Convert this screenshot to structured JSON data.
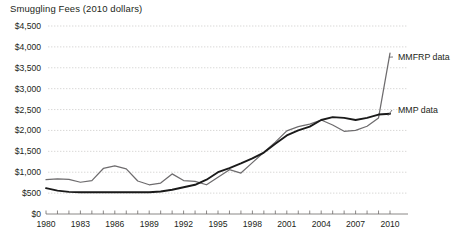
{
  "chart_data": {
    "type": "line",
    "title": "Smuggling Fees (2010 dollars)",
    "xlabel": "",
    "ylabel": "",
    "xlim": [
      1980,
      2010
    ],
    "ylim": [
      0,
      4500
    ],
    "ytick_step": 500,
    "grid": true,
    "legend_position": "inline-right",
    "x": [
      1980,
      1981,
      1982,
      1983,
      1984,
      1985,
      1986,
      1987,
      1988,
      1989,
      1990,
      1991,
      1992,
      1993,
      1994,
      1995,
      1996,
      1997,
      1998,
      1999,
      2000,
      2001,
      2002,
      2003,
      2004,
      2005,
      2006,
      2007,
      2008,
      2009,
      2010
    ],
    "categories": [
      "1980",
      "1981",
      "1982",
      "1983",
      "1984",
      "1985",
      "1986",
      "1987",
      "1988",
      "1989",
      "1990",
      "1991",
      "1992",
      "1993",
      "1994",
      "1995",
      "1996",
      "1997",
      "1998",
      "1999",
      "2000",
      "2001",
      "2002",
      "2003",
      "2004",
      "2005",
      "2006",
      "2007",
      "2008",
      "2009",
      "2010"
    ],
    "xtick_labels": [
      "1980",
      "1983",
      "1986",
      "1989",
      "1992",
      "1995",
      "1998",
      "2001",
      "2004",
      "2007",
      "2010"
    ],
    "ytick_labels": [
      "$0",
      "$500",
      "$1,000",
      "$1,500",
      "$2,000",
      "$2,500",
      "$3,000",
      "$3,500",
      "$4,000",
      "$4,500"
    ],
    "ytick_values": [
      0,
      500,
      1000,
      1500,
      2000,
      2500,
      3000,
      3500,
      4000,
      4500
    ],
    "series": [
      {
        "name": "MMFRP data",
        "label": "MMFRP data",
        "color": "#6e6c6e",
        "values": [
          820,
          840,
          830,
          760,
          800,
          1090,
          1150,
          1080,
          790,
          700,
          740,
          960,
          800,
          780,
          700,
          880,
          1060,
          980,
          1230,
          1480,
          1720,
          1990,
          2090,
          2150,
          2250,
          2130,
          1980,
          2000,
          2100,
          2300,
          3850
        ]
      },
      {
        "name": "MMP data",
        "label": "MMP data",
        "color": "#1a1a1a",
        "values": [
          620,
          560,
          530,
          520,
          520,
          520,
          520,
          520,
          520,
          520,
          540,
          580,
          640,
          700,
          820,
          1000,
          1100,
          1210,
          1330,
          1470,
          1680,
          1880,
          2000,
          2090,
          2250,
          2320,
          2300,
          2250,
          2300,
          2380,
          2400
        ]
      }
    ]
  }
}
